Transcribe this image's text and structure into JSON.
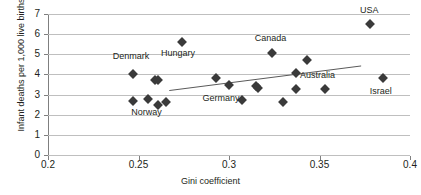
{
  "chart_data": {
    "type": "scatter",
    "title": "",
    "xlabel": "Gini coefficient",
    "ylabel": "Infant deaths per 1,000 live births",
    "xlim": [
      0.2,
      0.4
    ],
    "ylim": [
      0,
      7
    ],
    "xticks": [
      "0.2",
      "0.25",
      "0.3",
      "0.35",
      "0.4"
    ],
    "xtick_values": [
      0.2,
      0.25,
      0.3,
      0.35,
      0.4
    ],
    "yticks": [
      "0",
      "1",
      "2",
      "3",
      "4",
      "5",
      "6",
      "7"
    ],
    "ytick_values": [
      0,
      1,
      2,
      3,
      4,
      5,
      6,
      7
    ],
    "grid": "horizontal",
    "legend": "none",
    "marker": "diamond",
    "marker_color": "#3a3a3a",
    "gridline_color": "#bfbfbf",
    "axis_color": "#7f7f7f",
    "points": [
      {
        "x": 0.247,
        "y": 4.0,
        "label": "Denmark",
        "label_dx": -2,
        "label_dy": -18
      },
      {
        "x": 0.247,
        "y": 2.7,
        "label": "",
        "label_dx": 0,
        "label_dy": 0
      },
      {
        "x": 0.255,
        "y": 2.8,
        "label": "Norway",
        "label_dx": -1,
        "label_dy": 13
      },
      {
        "x": 0.259,
        "y": 3.7,
        "label": "",
        "label_dx": 0,
        "label_dy": 0
      },
      {
        "x": 0.261,
        "y": 3.7,
        "label": "",
        "label_dx": 0,
        "label_dy": 0
      },
      {
        "x": 0.261,
        "y": 2.5,
        "label": "",
        "label_dx": 0,
        "label_dy": 0
      },
      {
        "x": 0.265,
        "y": 2.62,
        "label": "",
        "label_dx": 0,
        "label_dy": 0
      },
      {
        "x": 0.274,
        "y": 5.6,
        "label": "Hungary",
        "label_dx": -4,
        "label_dy": 11
      },
      {
        "x": 0.293,
        "y": 3.8,
        "label": "",
        "label_dx": 0,
        "label_dy": 0
      },
      {
        "x": 0.3,
        "y": 3.5,
        "label": "Germany",
        "label_dx": -8,
        "label_dy": 13
      },
      {
        "x": 0.307,
        "y": 2.72,
        "label": "",
        "label_dx": 0,
        "label_dy": 0
      },
      {
        "x": 0.315,
        "y": 3.42,
        "label": "",
        "label_dx": 0,
        "label_dy": 0
      },
      {
        "x": 0.316,
        "y": 3.32,
        "label": "",
        "label_dx": 0,
        "label_dy": 0
      },
      {
        "x": 0.324,
        "y": 5.05,
        "label": "Canada",
        "label_dx": -2,
        "label_dy": -15
      },
      {
        "x": 0.33,
        "y": 2.62,
        "label": "",
        "label_dx": 0,
        "label_dy": 0
      },
      {
        "x": 0.337,
        "y": 4.08,
        "label": "Australia",
        "label_dx": 4,
        "label_dy": 2
      },
      {
        "x": 0.337,
        "y": 3.3,
        "label": "",
        "label_dx": 0,
        "label_dy": 0
      },
      {
        "x": 0.343,
        "y": 4.73,
        "label": "",
        "label_dx": 0,
        "label_dy": 0
      },
      {
        "x": 0.353,
        "y": 3.3,
        "label": "",
        "label_dx": 0,
        "label_dy": 0
      },
      {
        "x": 0.378,
        "y": 6.48,
        "label": "USA",
        "label_dx": -1,
        "label_dy": -14
      },
      {
        "x": 0.385,
        "y": 3.82,
        "label": "Israel",
        "label_dx": -2,
        "label_dy": 13
      }
    ],
    "trendline": {
      "x1": 0.267,
      "y1": 3.2,
      "x2": 0.373,
      "y2": 4.42,
      "color": "#5a5a5a"
    }
  }
}
